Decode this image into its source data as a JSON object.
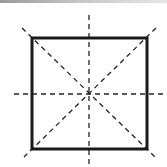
{
  "diagram": {
    "title": "",
    "colors": {
      "stroke": "#1a1a1a",
      "dash": "#222222",
      "background": "#ffffff"
    },
    "square": {
      "x": 32,
      "y": 38,
      "width": 115,
      "height": 111,
      "stroke_width": 3
    },
    "symmetry_lines": [
      {
        "name": "vertical-axis",
        "x1": 89,
        "y1": 15,
        "x2": 89,
        "y2": 167
      },
      {
        "name": "horizontal-axis",
        "x1": 14,
        "y1": 94,
        "x2": 167,
        "y2": 94
      },
      {
        "name": "diagonal-main",
        "x1": 22,
        "y1": 28,
        "x2": 156,
        "y2": 158
      },
      {
        "name": "diagonal-anti",
        "x1": 156,
        "y1": 28,
        "x2": 24,
        "y2": 157
      }
    ],
    "center": {
      "x": 89,
      "y": 94
    },
    "line_count": 4
  }
}
